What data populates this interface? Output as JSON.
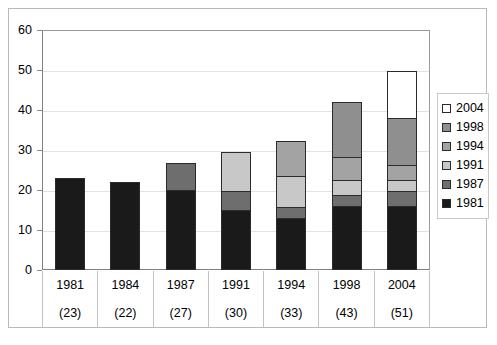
{
  "chart_data": {
    "type": "bar",
    "stacked": true,
    "title": "",
    "subtitle": "",
    "xlabel": "",
    "ylabel": "",
    "ylim": [
      0,
      60
    ],
    "ytick_values": [
      0,
      10,
      20,
      30,
      40,
      50,
      60
    ],
    "ytick_labels": [
      "0",
      "10",
      "20",
      "30",
      "40",
      "50",
      "60"
    ],
    "grid": true,
    "legend_position": "right",
    "categories": [
      "1981",
      "1984",
      "1987",
      "1991",
      "1994",
      "1998",
      "2004"
    ],
    "category_totals": [
      23,
      22,
      27,
      30,
      33,
      43,
      51
    ],
    "category_total_labels": [
      "(23)",
      "(22)",
      "(27)",
      "(30)",
      "(33)",
      "(43)",
      "(51)"
    ],
    "series": [
      {
        "name": "1981",
        "color": "#1a1a1a",
        "values": [
          23,
          22,
          20,
          15,
          13,
          16,
          16
        ]
      },
      {
        "name": "1987",
        "color": "#6e6e6e",
        "values": [
          0,
          0,
          7,
          5,
          3,
          3,
          4
        ]
      },
      {
        "name": "1991",
        "color": "#c8c8c8",
        "values": [
          0,
          0,
          0,
          10,
          8,
          4,
          3
        ]
      },
      {
        "name": "1994",
        "color": "#a3a3a3",
        "values": [
          0,
          0,
          0,
          0,
          9,
          6,
          4
        ]
      },
      {
        "name": "1998",
        "color": "#8f8f8f",
        "values": [
          0,
          0,
          0,
          0,
          0,
          14,
          12
        ]
      },
      {
        "name": "2004",
        "color": "#ffffff",
        "values": [
          0,
          0,
          0,
          0,
          0,
          0,
          12
        ]
      }
    ],
    "legend_order_top_to_bottom": [
      "2004",
      "1998",
      "1994",
      "1991",
      "1987",
      "1981"
    ]
  },
  "legend": {
    "entries": [
      {
        "label": "2004",
        "color": "#ffffff"
      },
      {
        "label": "1998",
        "color": "#8f8f8f"
      },
      {
        "label": "1994",
        "color": "#a3a3a3"
      },
      {
        "label": "1991",
        "color": "#c8c8c8"
      },
      {
        "label": "1987",
        "color": "#6e6e6e"
      },
      {
        "label": "1981",
        "color": "#1a1a1a"
      }
    ]
  },
  "axis": {
    "y_labels": [
      "60",
      "50",
      "40",
      "30",
      "20",
      "10",
      "0"
    ],
    "x_year_row": [
      "1981",
      "1984",
      "1987",
      "1991",
      "1994",
      "1998",
      "2004"
    ],
    "x_total_row": [
      "(23)",
      "(22)",
      "(27)",
      "(30)",
      "(33)",
      "(43)",
      "(51)"
    ]
  },
  "colors": {
    "grid": "#e3e3e3",
    "axis": "#808080",
    "frame": "#b9b9b9",
    "segment_border": "#2b2b2b",
    "background": "#ffffff"
  }
}
